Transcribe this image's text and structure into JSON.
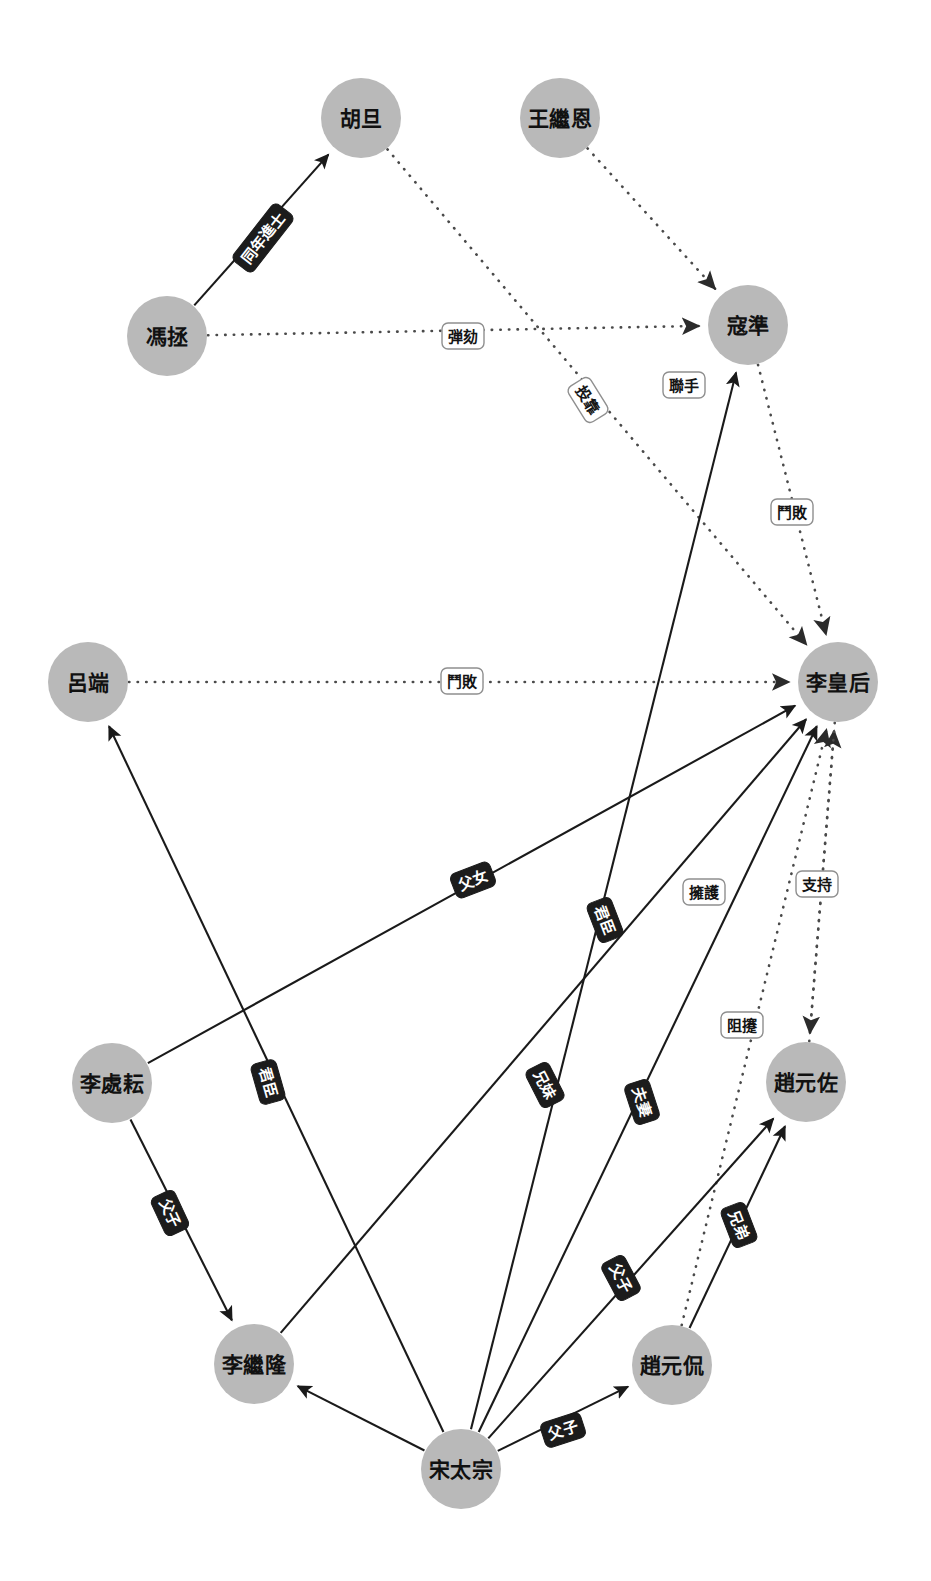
{
  "diagram": {
    "type": "social-network-graph",
    "width": 931,
    "height": 1581,
    "background_color": "#ffffff",
    "node_fill_color": "#b9b9b9",
    "solid_edge_color": "#1a1a1a",
    "dotted_edge_color": "#4a4a4a",
    "dark_label_bg": "#1c1c1c",
    "dark_label_fg": "#ffffff",
    "light_label_bg": "#ffffff",
    "light_label_fg": "#141414",
    "light_label_border": "#8f8f8f"
  },
  "nodes": [
    {
      "id": "hudan",
      "label": "胡旦",
      "x": 361,
      "y": 118,
      "r": 40
    },
    {
      "id": "wangjien",
      "label": "王繼恩",
      "x": 560,
      "y": 118,
      "r": 40
    },
    {
      "id": "fengzheng",
      "label": "馮拯",
      "x": 167,
      "y": 336,
      "r": 40
    },
    {
      "id": "kouzhun",
      "label": "寇準",
      "x": 748,
      "y": 325,
      "r": 40
    },
    {
      "id": "luduan",
      "label": "呂端",
      "x": 88,
      "y": 682,
      "r": 40
    },
    {
      "id": "lihuanghou",
      "label": "李皇后",
      "x": 838,
      "y": 682,
      "r": 40
    },
    {
      "id": "lichuyun",
      "label": "李處耘",
      "x": 112,
      "y": 1083,
      "r": 40
    },
    {
      "id": "zhaoyuanzuo",
      "label": "趙元佐",
      "x": 806,
      "y": 1082,
      "r": 40
    },
    {
      "id": "lijilong",
      "label": "李繼隆",
      "x": 254,
      "y": 1364,
      "r": 40
    },
    {
      "id": "zhaoyuankan",
      "label": "趙元侃",
      "x": 672,
      "y": 1365,
      "r": 40
    },
    {
      "id": "songtaizong",
      "label": "宋太宗",
      "x": 461,
      "y": 1469,
      "r": 40
    }
  ],
  "edges": [
    {
      "id": "e1",
      "source": "fengzheng",
      "target": "hudan",
      "label": "同年進士",
      "style": "solid",
      "label_style": "dark",
      "lx": 263,
      "ly": 238,
      "rot": -52
    },
    {
      "id": "e2",
      "source": "fengzheng",
      "target": "kouzhun",
      "label": "弾劾",
      "style": "dotted",
      "label_style": "light",
      "lx": 463,
      "ly": 336,
      "rot": 0
    },
    {
      "id": "e3",
      "source": "hudan",
      "target": "lihuanghou",
      "label": "投靠",
      "style": "dotted",
      "label_style": "light",
      "lx": 588,
      "ly": 400,
      "rot": 58
    },
    {
      "id": "e4",
      "source": "wangjien",
      "target": "kouzhun",
      "label": "",
      "style": "dotted",
      "label_style": "light",
      "lx": 0,
      "ly": 0,
      "rot": 0
    },
    {
      "id": "e5",
      "source": "songtaizong",
      "target": "kouzhun",
      "label": "聯手",
      "style": "solid",
      "label_style": "light",
      "lx": 684,
      "ly": 385,
      "rot": 0
    },
    {
      "id": "e6",
      "source": "kouzhun",
      "target": "lihuanghou",
      "label": "鬥敗",
      "style": "dotted",
      "label_style": "light",
      "lx": 792,
      "ly": 512,
      "rot": 0
    },
    {
      "id": "e7",
      "source": "luduan",
      "target": "lihuanghou",
      "label": "鬥敗",
      "style": "dotted",
      "label_style": "light",
      "lx": 462,
      "ly": 681,
      "rot": 0
    },
    {
      "id": "e8",
      "source": "lichuyun",
      "target": "lihuanghou",
      "label": "父女",
      "style": "solid",
      "label_style": "dark",
      "lx": 473,
      "ly": 880,
      "rot": -21
    },
    {
      "id": "e9",
      "source": "lichuyun",
      "target": "lijilong",
      "label": "父子",
      "style": "solid",
      "label_style": "dark",
      "lx": 170,
      "ly": 1213,
      "rot": 65
    },
    {
      "id": "e10",
      "source": "songtaizong",
      "target": "luduan",
      "label": "君臣",
      "style": "solid",
      "label_style": "dark",
      "lx": 268,
      "ly": 1082,
      "rot": 74
    },
    {
      "id": "e11",
      "source": "songtaizong",
      "target": "lijilong",
      "label": "君臣",
      "style": "solid",
      "label_style": "dark",
      "lx": 605,
      "ly": 920,
      "rot": 69
    },
    {
      "id": "e12",
      "source": "lijilong",
      "target": "lihuanghou",
      "label": "兄妹",
      "style": "solid",
      "label_style": "dark",
      "lx": 545,
      "ly": 1085,
      "rot": 63
    },
    {
      "id": "e13",
      "source": "songtaizong",
      "target": "lihuanghou",
      "label": "夫妻",
      "style": "solid",
      "label_style": "dark",
      "lx": 642,
      "ly": 1102,
      "rot": 72
    },
    {
      "id": "e14",
      "source": "zhaoyuanzuo",
      "target": "lihuanghou",
      "label": "擁護",
      "style": "dotted",
      "label_style": "light",
      "lx": 704,
      "ly": 892,
      "rot": 0
    },
    {
      "id": "e15",
      "source": "zhaoyuankan",
      "target": "lihuanghou",
      "label": "支持",
      "style": "dotted",
      "label_style": "light",
      "lx": 817,
      "ly": 884,
      "rot": 0
    },
    {
      "id": "e16",
      "source": "lihuanghou",
      "target": "zhaoyuanzuo",
      "label": "阻攓",
      "style": "dotted",
      "label_style": "light",
      "lx": 742,
      "ly": 1025,
      "rot": 0
    },
    {
      "id": "e17",
      "source": "songtaizong",
      "target": "zhaoyuanzuo",
      "label": "父子",
      "style": "solid",
      "label_style": "dark",
      "lx": 621,
      "ly": 1278,
      "rot": 62
    },
    {
      "id": "e18",
      "source": "zhaoyuankan",
      "target": "zhaoyuanzuo",
      "label": "兄弟",
      "style": "solid",
      "label_style": "dark",
      "lx": 739,
      "ly": 1225,
      "rot": 69
    },
    {
      "id": "e19",
      "source": "songtaizong",
      "target": "zhaoyuankan",
      "label": "父子",
      "style": "solid",
      "label_style": "dark",
      "lx": 563,
      "ly": 1430,
      "rot": -18
    }
  ],
  "edge_labels": {
    "tongnianjinshi": "同年進士",
    "tanhe": "弾劾",
    "toukao": "投靠",
    "lianshou": "聯手",
    "doubai": "鬥敗",
    "funv": "父女",
    "fuzi": "父子",
    "junchen": "君臣",
    "xiongmei": "兄妹",
    "fuqi": "夫妻",
    "yonghu": "擁護",
    "zhichi": "支持",
    "zunao": "阻攓",
    "xiongdi": "兄弟"
  }
}
